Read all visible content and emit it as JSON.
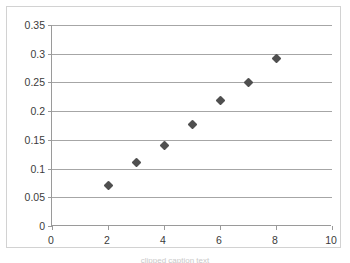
{
  "chart_data": {
    "type": "scatter",
    "title": "",
    "subtitle": "",
    "xlabel": "",
    "ylabel": "",
    "xlim": [
      0,
      10
    ],
    "ylim": [
      0,
      0.35
    ],
    "xticks": [
      0,
      2,
      4,
      6,
      8,
      10
    ],
    "yticks": [
      0,
      0.05,
      0.1,
      0.15,
      0.2,
      0.25,
      0.3,
      0.35
    ],
    "xtick_labels": [
      "0",
      "2",
      "4",
      "6",
      "8",
      "10"
    ],
    "ytick_labels": [
      "0",
      "0.05",
      "0.1",
      "0.15",
      "0.2",
      "0.25",
      "0.3",
      "0.35"
    ],
    "grid": "horizontal",
    "legend": "none",
    "marker": "diamond",
    "marker_color": "#4f4f4f",
    "gridline_color": "#a6a6a6",
    "axis_color": "#9a9a9a",
    "frame_color": "#d2d2d2",
    "background_color": "#ffffff",
    "series": [
      {
        "name": "Series 1",
        "x": [
          2,
          3,
          4,
          5,
          6,
          7,
          8
        ],
        "values": [
          0.07,
          0.11,
          0.141,
          0.177,
          0.218,
          0.25,
          0.291
        ]
      }
    ]
  },
  "caption": {
    "text": "clipped caption text"
  }
}
